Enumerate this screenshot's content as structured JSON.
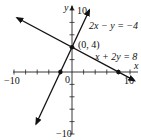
{
  "chart_data": {
    "type": "line",
    "title": "",
    "xlabel": "x",
    "ylabel": "y",
    "xlim": [
      -10,
      10
    ],
    "ylim": [
      -10,
      10
    ],
    "grid": false,
    "x_tick_step": 2,
    "y_tick_step": 2,
    "tick_labels": {
      "x": [
        "-10",
        "10"
      ],
      "y": [
        "10",
        "-10"
      ],
      "origin": "0"
    },
    "series": [
      {
        "name": "2x − y = −4",
        "equation": "2x - y = -4",
        "slope": 2,
        "intercept": 4,
        "points": [
          [
            -6.2,
            -8.4
          ],
          [
            -2,
            0
          ],
          [
            0,
            4
          ],
          [
            3,
            10
          ]
        ]
      },
      {
        "name": "x + 2y = 8",
        "equation": "x + 2y = 8",
        "slope": -0.5,
        "intercept": 4,
        "points": [
          [
            -9.5,
            8.75
          ],
          [
            0,
            4
          ],
          [
            8,
            0
          ],
          [
            10.8,
            -1.4
          ]
        ]
      }
    ],
    "annotations": [
      {
        "text": "(0, 4)",
        "point": [
          0,
          4
        ]
      },
      {
        "text": "2x − y = −4"
      },
      {
        "text": "x + 2y = 8"
      }
    ],
    "marked_points": [
      [
        0,
        4
      ],
      [
        -2,
        0
      ],
      [
        8,
        0
      ]
    ]
  },
  "labels": {
    "y_axis": "y",
    "x_axis": "x",
    "y_top": "10",
    "y_bottom": "−10",
    "x_left": "−10",
    "x_right": "10",
    "origin": "0",
    "intersection": "(0, 4)",
    "eq1_lhs": "2x − y = −4",
    "eq2_lhs": "x + 2y = 8"
  }
}
